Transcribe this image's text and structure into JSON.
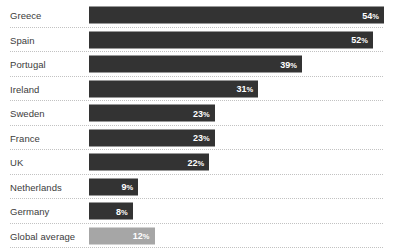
{
  "chart_data": {
    "type": "bar",
    "orientation": "horizontal",
    "title": "",
    "subtitle": "",
    "xlabel": "",
    "ylabel": "",
    "xlim": [
      0,
      54
    ],
    "grid": "horizontal-dotted",
    "legend": "none",
    "value_suffix": "%",
    "categories": [
      "Greece",
      "Spain",
      "Portugal",
      "Ireland",
      "Sweden",
      "France",
      "UK",
      "Netherlands",
      "Germany",
      "Global average"
    ],
    "values": [
      54,
      52,
      39,
      31,
      23,
      23,
      22,
      9,
      8,
      12
    ],
    "labels": [
      "54%",
      "52%",
      "39%",
      "31%",
      "23%",
      "23%",
      "22%",
      "9%",
      "8%",
      "12%"
    ]
  },
  "rows": [
    {
      "label": "Greece",
      "value": 54,
      "value_label": "54",
      "suffix": "%",
      "highlight": false
    },
    {
      "label": "Spain",
      "value": 52,
      "value_label": "52",
      "suffix": "%",
      "highlight": false
    },
    {
      "label": "Portugal",
      "value": 39,
      "value_label": "39",
      "suffix": "%",
      "highlight": false
    },
    {
      "label": "Ireland",
      "value": 31,
      "value_label": "31",
      "suffix": "%",
      "highlight": false
    },
    {
      "label": "Sweden",
      "value": 23,
      "value_label": "23",
      "suffix": "%",
      "highlight": false
    },
    {
      "label": "France",
      "value": 23,
      "value_label": "23",
      "suffix": "%",
      "highlight": false
    },
    {
      "label": "UK",
      "value": 22,
      "value_label": "22",
      "suffix": "%",
      "highlight": false
    },
    {
      "label": "Netherlands",
      "value": 9,
      "value_label": "9",
      "suffix": "%",
      "highlight": false
    },
    {
      "label": "Germany",
      "value": 8,
      "value_label": "8",
      "suffix": "%",
      "highlight": false
    },
    {
      "label": "Global average",
      "value": 12,
      "value_label": "12",
      "suffix": "%",
      "highlight": true
    }
  ],
  "style": {
    "bar_color": "#333333",
    "bar_color_highlight": "#a6a6a6",
    "value_text_color": "#ffffff",
    "label_text_color": "#3c3c3c",
    "gridline_color": "#c2c2c2",
    "background": "#ffffff"
  },
  "layout": {
    "bar_origin_x": 89,
    "bar_scale_px_per_unit": 5.46,
    "plot_right_x": 383,
    "row_height": 24.5,
    "first_row_top": 3,
    "bar_height": 17
  }
}
